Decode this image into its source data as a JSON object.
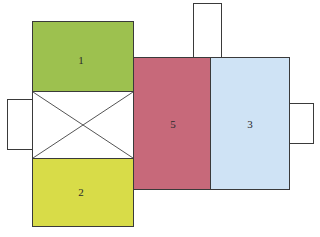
{
  "diagram": {
    "colors": {
      "room1": "#9dc14f",
      "room2": "#d8dc48",
      "room5": "#c7697a",
      "room3": "#cfe3f5",
      "outline": "#3a3a3a"
    },
    "rooms": [
      {
        "id": "1",
        "label": "1"
      },
      {
        "id": "2",
        "label": "2"
      },
      {
        "id": "5",
        "label": "5"
      },
      {
        "id": "3",
        "label": "3"
      }
    ],
    "crossed_room": {
      "label": ""
    },
    "small_boxes": [
      "left",
      "top",
      "right"
    ]
  }
}
